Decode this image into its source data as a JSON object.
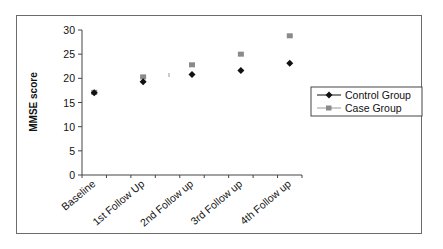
{
  "chart_data": {
    "type": "scatter",
    "title": "",
    "xlabel": "",
    "ylabel": "MMSE score",
    "categories": [
      "Baseline",
      "1st Follow Up",
      "2nd Follow up",
      "3rd Follow up",
      "4th Follow up"
    ],
    "series": [
      {
        "name": "Control Group",
        "marker": "diamond",
        "color": "#111111",
        "values": [
          17.0,
          19.3,
          20.8,
          21.6,
          23.1
        ]
      },
      {
        "name": "Case Group",
        "marker": "square",
        "color": "#8a8a8a",
        "values": [
          17.1,
          20.3,
          22.8,
          25.0,
          28.8
        ]
      }
    ],
    "ylim": [
      0,
      30
    ],
    "yticks": [
      0,
      5,
      10,
      15,
      20,
      25,
      30
    ],
    "grid": false,
    "legend_position": "right"
  },
  "axis": {
    "y_title": "MMSE score",
    "y_tick_labels": [
      "0",
      "5",
      "10",
      "15",
      "20",
      "25",
      "30"
    ],
    "x_tick_labels": [
      "Baseline",
      "1st Follow Up",
      "2nd Follow up",
      "3rd Follow up",
      "4th Follow up"
    ]
  },
  "legend": {
    "items": [
      {
        "label": "Control Group",
        "icon": "diamond-marker-icon"
      },
      {
        "label": "Case Group",
        "icon": "square-marker-icon"
      }
    ]
  }
}
